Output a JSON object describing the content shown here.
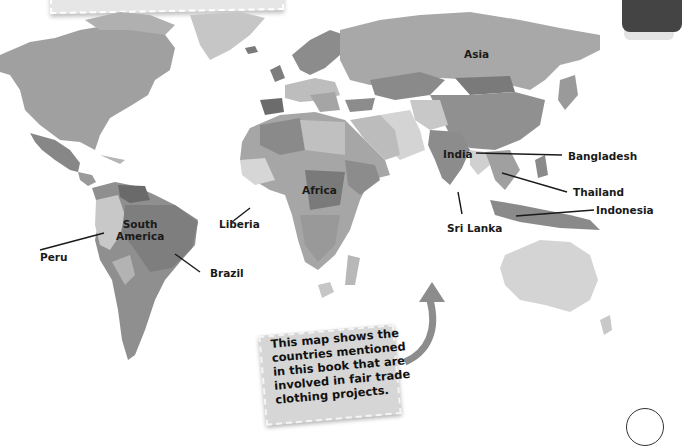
{
  "map": {
    "title_note": "",
    "labels": {
      "asia": "Asia",
      "africa": "Africa",
      "south_america": "South\nAmerica",
      "india": "India",
      "bangladesh": "Bangladesh",
      "thailand": "Thailand",
      "indonesia": "Indonesia",
      "sri_lanka": "Sri Lanka",
      "liberia": "Liberia",
      "peru": "Peru",
      "brazil": "Brazil"
    },
    "caption": "This map shows the countries mentioned in this book that are involved in fair trade clothing projects.",
    "colors": {
      "land_dark": "#8a8a8a",
      "land_mid": "#a3a3a3",
      "land_light": "#c4c4c4",
      "land_pale": "#d9d9d9",
      "ocean": "#ffffff",
      "arrow": "#8c8c8c",
      "note_bg": "#d6d6d6"
    }
  }
}
